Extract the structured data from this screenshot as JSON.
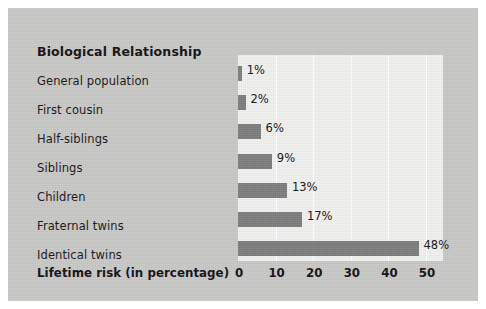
{
  "figure": {
    "title": "Biological Relationship",
    "axis_title": "Lifetime risk (in percentage)",
    "background_color": "#c9c9c7",
    "plot_background_color": "#f1f1ef",
    "bar_color": "#7e7e7e",
    "gridline_color": "#ffffff",
    "text_color": "#141414"
  },
  "chart_data": {
    "type": "bar",
    "orientation": "horizontal",
    "title": "Biological Relationship",
    "xlabel": "Lifetime risk (in percentage)",
    "ylabel": "Biological Relationship",
    "categories": [
      "General population",
      "First cousin",
      "Half-siblings",
      "Siblings",
      "Children",
      "Fraternal twins",
      "Identical twins"
    ],
    "values": [
      1,
      2,
      6,
      9,
      13,
      17,
      48
    ],
    "value_labels": [
      "1%",
      "2%",
      "6%",
      "9%",
      "13%",
      "17%",
      "48%"
    ],
    "xlim": [
      0,
      54.5
    ],
    "xticks": [
      0,
      10,
      20,
      30,
      40,
      50
    ],
    "xtick_labels": [
      "0",
      "10",
      "20",
      "30",
      "40",
      "50"
    ],
    "grid": true,
    "grid_axis": "x",
    "legend": false,
    "legend_position": "none"
  }
}
